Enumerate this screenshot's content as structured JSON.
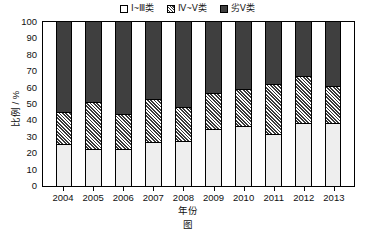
{
  "chart_data": {
    "type": "bar",
    "subtype": "stacked-100-percent",
    "title": "",
    "xlabel": "年份",
    "ylabel": "比例 / %",
    "ylim": [
      0,
      100
    ],
    "ytick_step": 10,
    "yticks": [
      100,
      90,
      80,
      70,
      60,
      50,
      40,
      30,
      20,
      10,
      0
    ],
    "grid": false,
    "legend_position": "top-center",
    "categories": [
      "2004",
      "2005",
      "2006",
      "2007",
      "2008",
      "2009",
      "2010",
      "2011",
      "2012",
      "2013"
    ],
    "series": [
      {
        "name": "Ⅰ~Ⅲ类",
        "fill": "white",
        "color": "#eeeeee",
        "values": [
          25,
          22,
          22,
          26,
          27,
          34,
          36,
          31,
          38,
          38
        ]
      },
      {
        "name": "Ⅳ~Ⅴ类",
        "fill": "hatched",
        "color": "#3a3a3a",
        "values": [
          20,
          29,
          22,
          27,
          21,
          23,
          23,
          31,
          29,
          23
        ]
      },
      {
        "name": "劣Ⅴ类",
        "fill": "solid-dark",
        "color": "#3f3f3f",
        "values": [
          55,
          49,
          56,
          47,
          52,
          43,
          41,
          38,
          33,
          39
        ]
      }
    ],
    "cumulative_tops": {
      "class_1_3": [
        25,
        22,
        22,
        26,
        27,
        34,
        36,
        31,
        38,
        38
      ],
      "class_4_5": [
        45,
        51,
        44,
        53,
        48,
        57,
        59,
        62,
        67,
        61
      ]
    }
  },
  "legend": {
    "items": [
      {
        "label": "Ⅰ~Ⅲ类",
        "swatch": "white-square-icon"
      },
      {
        "label": "Ⅳ~Ⅴ类",
        "swatch": "hatched-square-icon"
      },
      {
        "label": "劣Ⅴ类",
        "swatch": "dark-square-icon"
      }
    ]
  },
  "axes": {
    "y_title": "比例 / %",
    "x_title": "年份"
  },
  "caption": "图"
}
